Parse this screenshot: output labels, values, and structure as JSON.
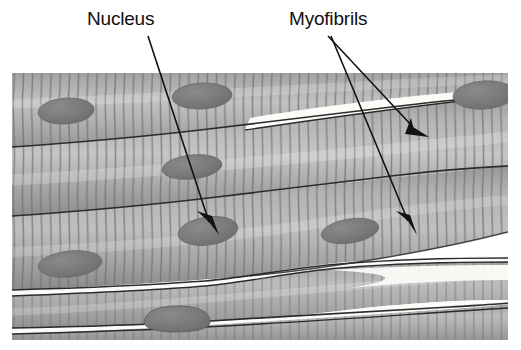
{
  "figure": {
    "kind": "histology-diagram",
    "background_color": "#ffffff",
    "image_area": {
      "x": 12,
      "y": 73,
      "width": 496,
      "height": 267
    }
  },
  "labels": [
    {
      "id": "nucleus",
      "text": "Nucleus",
      "x": 87,
      "y": 9,
      "color": "#0f0f0f",
      "font_size": 19
    },
    {
      "id": "myofibrils",
      "text": "Myofibrils",
      "x": 289,
      "y": 9,
      "color": "#0f0f0f",
      "font_size": 19
    }
  ],
  "leader_lines": [
    {
      "for": "nucleus",
      "from": [
        148,
        36
      ],
      "to": [
        213,
        228
      ],
      "arrowhead": true,
      "color": "#121212"
    },
    {
      "for": "myofibrils",
      "from": [
        328,
        36
      ],
      "to": [
        418,
        132
      ],
      "arrowhead": true,
      "color": "#121212"
    },
    {
      "for": "myofibrils",
      "from": [
        330,
        36
      ],
      "to": [
        412,
        228
      ],
      "arrowhead": true,
      "color": "#121212"
    }
  ],
  "palette": {
    "fiber_light": "#b9b9b9",
    "fiber_mid": "#a3a3a3",
    "fiber_dark": "#8e8e8e",
    "fiber_shadow": "#7d7d7d",
    "striation": "#6f6f6f",
    "boundary": "#2b2b2b",
    "nucleus": "#7a7a7a",
    "nucleus_edge": "#6a6a6a",
    "gap_white": "#fbfbf8",
    "arrow": "#121212"
  },
  "tissue_structure": {
    "striation_spacing_px": 9,
    "fiber_bands": [
      {
        "id": "band-1",
        "top": 73,
        "bottom": 145,
        "note": "upper fiber, gently waving"
      },
      {
        "id": "band-2",
        "top": 145,
        "bottom": 218,
        "note": "middle fiber"
      },
      {
        "id": "band-3",
        "top": 218,
        "bottom": 288,
        "note": "lower fiber, tapering right"
      },
      {
        "id": "band-4",
        "top": 288,
        "bottom": 340,
        "note": "bottom fibers split by white gaps"
      }
    ],
    "nuclei": [
      {
        "cx": 66,
        "cy": 111,
        "rx": 28,
        "ry": 13,
        "rot": -4
      },
      {
        "cx": 202,
        "cy": 96,
        "rx": 30,
        "ry": 13,
        "rot": -3
      },
      {
        "cx": 482,
        "cy": 96,
        "rx": 30,
        "ry": 14,
        "rot": -4
      },
      {
        "cx": 192,
        "cy": 167,
        "rx": 30,
        "ry": 12,
        "rot": -6
      },
      {
        "cx": 208,
        "cy": 231,
        "rx": 30,
        "ry": 14,
        "rot": -8
      },
      {
        "cx": 350,
        "cy": 231,
        "rx": 29,
        "ry": 12,
        "rot": -9
      },
      {
        "cx": 70,
        "cy": 264,
        "rx": 32,
        "ry": 13,
        "rot": -6
      },
      {
        "cx": 176,
        "cy": 320,
        "rx": 32,
        "ry": 11,
        "rot": -2
      }
    ],
    "white_gaps": [
      {
        "id": "gap-top-right",
        "note": "wedge between upper and middle fiber, right of center"
      },
      {
        "id": "gap-bottom-left",
        "note": "wedge above bottom fiber, left half"
      },
      {
        "id": "gap-bottom-right",
        "note": "two tapering wedges, right half"
      }
    ]
  }
}
